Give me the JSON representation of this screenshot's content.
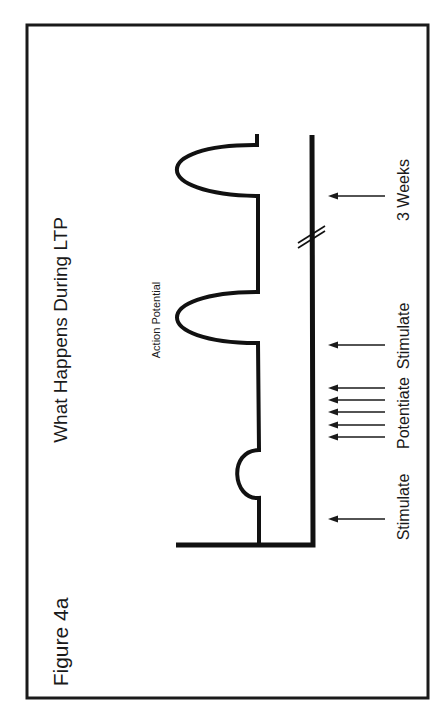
{
  "figure": {
    "label": "Figure 4a",
    "title": "What Happens During LTP",
    "orientation": "rotated 90° counter-clockwise (landscape page shown in portrait)",
    "annotations": {
      "action_potential": "Action Potential"
    },
    "events": [
      {
        "label": "Stimulate",
        "arrow_count": 1,
        "response": "small EPSP (sub-threshold bump)"
      },
      {
        "label": "Potentiate",
        "arrow_count": 5,
        "response": "tetanic stimulation (no trace response shown)"
      },
      {
        "label": "Stimulate",
        "arrow_count": 1,
        "response": "action potential"
      },
      {
        "label": "3 Weeks",
        "arrow_count": 1,
        "response": "action potential (persists)"
      }
    ],
    "time_axis": {
      "has_break": true,
      "break_symbol": "//"
    },
    "colors": {
      "line": "#111111",
      "text": "#1a1a1a",
      "background": "#ffffff"
    }
  }
}
